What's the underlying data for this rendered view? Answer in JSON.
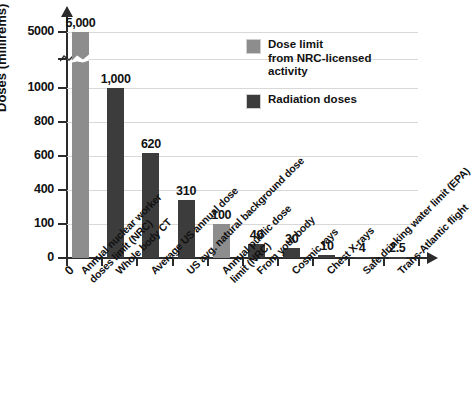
{
  "chart_data": {
    "type": "bar",
    "title": "",
    "subtitle": "",
    "xlabel": "",
    "ylabel": "Doses (millirems)",
    "grid": true,
    "legend_position": "top-right",
    "axis_note": "y-axis is broken between 1000 and 5000",
    "ylim": [
      0,
      5000
    ],
    "yticks": [
      0,
      100,
      400,
      600,
      800,
      1000,
      5000
    ],
    "ytick_labels": [
      "0",
      "100",
      "400",
      "600",
      "800",
      "1000",
      "5000"
    ],
    "categories": [
      "Annual nuclear worker doses limit (NRC)",
      "Whole body CT",
      "Average US annual dose",
      "US avg. natural background dose",
      "Annual public dose limit (NRC)",
      "From your body",
      "Cosmic rays",
      "Chest X-rays",
      "Safe drinking water limit (EPA)",
      "Trans-Atlantic flight"
    ],
    "category_lines": [
      [
        "Annual nuclear worker",
        "doses limit (NRC)"
      ],
      [
        "Whole body CT"
      ],
      [
        "Average US annual dose"
      ],
      [
        "US avg. natural background dose"
      ],
      [
        "Annual public dose",
        "limit (NRC)"
      ],
      [
        "From your body"
      ],
      [
        "Cosmic rays"
      ],
      [
        "Chest X-rays"
      ],
      [
        "Safe drinking water limit (EPA)"
      ],
      [
        "Trans-Atlantic flight"
      ]
    ],
    "values": [
      5000,
      1000,
      620,
      310,
      100,
      40,
      30,
      10,
      4,
      2.5
    ],
    "value_labels": [
      "5,000",
      "1,000",
      "620",
      "310",
      "100",
      "40",
      "30",
      "10",
      "4",
      "2.5"
    ],
    "series_of_bar": [
      "dose-limit",
      "radiation",
      "radiation",
      "radiation",
      "dose-limit",
      "radiation",
      "radiation",
      "radiation",
      "radiation",
      "radiation"
    ],
    "series": [
      {
        "name": "Dose limit from NRC-licensed activity",
        "color": "#8d8d8d",
        "values": [
          5000,
          null,
          null,
          null,
          100,
          null,
          null,
          null,
          null,
          null
        ]
      },
      {
        "name": "Radiation doses",
        "color": "#3c3c3c",
        "values": [
          null,
          1000,
          620,
          310,
          null,
          40,
          30,
          10,
          4,
          2.5
        ]
      }
    ]
  },
  "legend": {
    "items": [
      {
        "label_lines": [
          "Dose limit",
          "from NRC-licensed",
          "activity"
        ],
        "color": "#8d8d8d"
      },
      {
        "label_lines": [
          "Radiation doses"
        ],
        "color": "#3c3c3c"
      }
    ]
  },
  "axis": {
    "zero_origin_label": "0"
  },
  "colors": {
    "dose_limit": "#8d8d8d",
    "radiation": "#3c3c3c",
    "axis": "#2b2b2b",
    "grid": "#d8d8d8",
    "background": "#ffffff"
  }
}
